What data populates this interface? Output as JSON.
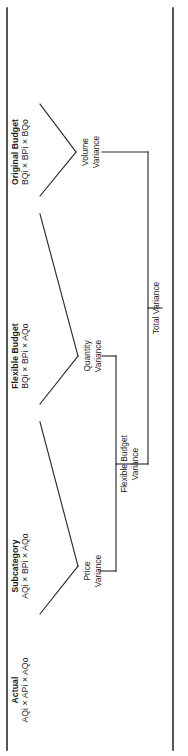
{
  "diagram": {
    "orientation": "rotated-90-ccw",
    "line_color": "#2b2b2b",
    "text_color": "#1c1c1c",
    "levels": [
      {
        "id": "original-budget",
        "heading": "Original Budget",
        "formula": "BQi × BPi × BQo"
      },
      {
        "id": "flexible-budget",
        "heading": "Flexible Budget",
        "formula": "BQi × BPi × AQo"
      },
      {
        "id": "subcategory",
        "heading": "Subcategory",
        "formula": "AQi × BPi × AQo"
      },
      {
        "id": "actual",
        "heading": "Actual",
        "formula": "AQi × APi × AQo"
      }
    ],
    "variances": [
      {
        "id": "volume-variance",
        "line1": "Volume",
        "line2": "Variance"
      },
      {
        "id": "quantity-variance",
        "line1": "Quantity",
        "line2": "Variance"
      },
      {
        "id": "price-variance",
        "line1": "Price",
        "line2": "Variance"
      }
    ],
    "aggregates": [
      {
        "id": "flexible-budget-variance",
        "line1": "Flexible Budget",
        "line2": "Variance"
      },
      {
        "id": "total-variance",
        "line1": "Total Variance",
        "line2": ""
      }
    ]
  }
}
